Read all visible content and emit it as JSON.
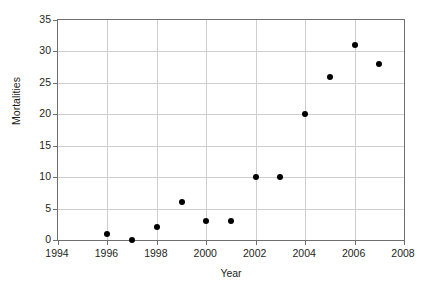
{
  "chart_data": {
    "type": "scatter",
    "title": "",
    "xlabel": "Year",
    "ylabel": "Mortalities",
    "xlim": [
      1994,
      2008
    ],
    "ylim": [
      0,
      35
    ],
    "xticks": [
      1994,
      1996,
      1998,
      2000,
      2002,
      2004,
      2006,
      2008
    ],
    "yticks": [
      0,
      5,
      10,
      15,
      20,
      25,
      30,
      35
    ],
    "xtick_labels": [
      "1994",
      "1996",
      "1998",
      "2000",
      "2002",
      "2004",
      "2006",
      "2008"
    ],
    "ytick_labels": [
      "0",
      "5",
      "10",
      "15",
      "20",
      "25",
      "30",
      "35"
    ],
    "grid": true,
    "legend": false,
    "marker": "filled-circle",
    "marker_color": "#000000",
    "gridline_color": "#cfcfcf",
    "axis_color": "#6f6f6f",
    "background_color": "#ffffff",
    "x": [
      1996,
      1997,
      1998,
      1999,
      2000,
      2001,
      2002,
      2003,
      2004,
      2005,
      2006,
      2007
    ],
    "values": [
      1,
      0,
      2,
      6,
      3,
      3,
      10,
      10,
      20,
      26,
      31,
      28
    ],
    "points": [
      {
        "x": 1996,
        "y": 1
      },
      {
        "x": 1997,
        "y": 0
      },
      {
        "x": 1998,
        "y": 2
      },
      {
        "x": 1999,
        "y": 6
      },
      {
        "x": 2000,
        "y": 3
      },
      {
        "x": 2001,
        "y": 3
      },
      {
        "x": 2002,
        "y": 10
      },
      {
        "x": 2003,
        "y": 10
      },
      {
        "x": 2004,
        "y": 20
      },
      {
        "x": 2005,
        "y": 26
      },
      {
        "x": 2006,
        "y": 31
      },
      {
        "x": 2007,
        "y": 28
      }
    ]
  }
}
